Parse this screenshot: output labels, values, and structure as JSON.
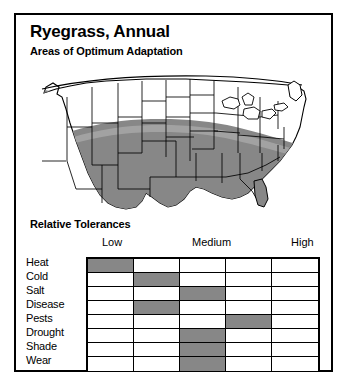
{
  "card": {
    "title": "Ryegrass, Annual",
    "subtitle": "Areas of Optimum Adaptation",
    "tolerances_title": "Relative Tolerances"
  },
  "map": {
    "name": "united-states-adaptation-map",
    "shaded_region_label": "Areas of Optimum Adaptation",
    "shaded_color": "#878787",
    "unshaded_color": "#ffffff",
    "outline_color": "#000000"
  },
  "tolerances": {
    "column_headers": [
      "Low",
      "Medium",
      "High"
    ],
    "columns": 5,
    "rows": [
      {
        "label": "Heat",
        "rating_column": 1
      },
      {
        "label": "Cold",
        "rating_column": 2
      },
      {
        "label": "Salt",
        "rating_column": 3
      },
      {
        "label": "Disease",
        "rating_column": 2
      },
      {
        "label": "Pests",
        "rating_column": 4
      },
      {
        "label": "Drought",
        "rating_column": 3
      },
      {
        "label": "Shade",
        "rating_column": 3
      },
      {
        "label": "Wear",
        "rating_column": 3
      }
    ],
    "filled_color": "#878787",
    "empty_color": "#ffffff"
  }
}
